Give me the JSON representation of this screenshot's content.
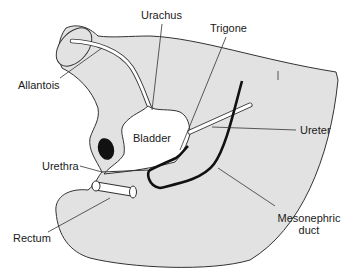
{
  "figure": {
    "type": "anatomical-diagram",
    "colors": {
      "tissue_fill": "#e2e2e2",
      "outline": "#333333",
      "duct": "#111111",
      "lumen": "#ffffff",
      "background": "#ffffff"
    }
  },
  "labels": {
    "urachus": "Urachus",
    "trigone": "Trigone",
    "allantois": "Allantois",
    "bladder": "Bladder",
    "ureter": "Ureter",
    "urethra": "Urethra",
    "rectum": "Rectum",
    "mesonephric_line1": "Mesonephric",
    "mesonephric_line2": "duct"
  }
}
